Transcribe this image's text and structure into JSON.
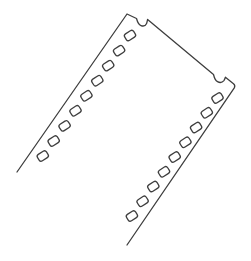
{
  "page": {
    "background_color": "#ffffff"
  },
  "illustration": {
    "description": "Hand-drawn dark-gray outline sketch of a strip of 35mm photographic film tilted diagonally (top end upper-right, lower end running off open toward bottom-left and bottom-right). Two small rounded notches are cut into the top end edge near each corner, and a row of nine small rounded rectangular sprocket holes runs parallel to each long edge.",
    "stroke_color": "#3e3e3e",
    "background_color": "#ffffff",
    "stroke_width": 1.3,
    "canvas": {
      "width": 251,
      "height": 261
    },
    "outline_path": "M 17 172 L 127 14 L 136.5 18.5 C 137.4 21.8 138.4 24.6 141 25.6 C 143.6 26.6 145.6 25.6 146.6 23.4 C 147.2 22 147.3 20.8 147.6 19.4 L 213.5 74.5 C 214.2 77.4 215 80.4 217.5 81.7 C 220 83 222.3 82.5 223.9 80.6 C 224.7 79.6 225 78.4 225.4 77.2 L 233.5 83.7 Q 235.6 85.4 234.3 87.9 L 127 245",
    "sprocket_holes": {
      "count_per_row": 9,
      "width": 10.6,
      "height": 7.6,
      "corner_radius": 2.4,
      "rotation_deg": -33,
      "left_row_centers": [
        [
          130,
          35.5
        ],
        [
          119.1,
          50.6
        ],
        [
          108.2,
          65.6
        ],
        [
          97.3,
          80.7
        ],
        [
          86.4,
          95.8
        ],
        [
          75.5,
          110.8
        ],
        [
          64.6,
          125.9
        ],
        [
          53.7,
          141
        ],
        [
          42.8,
          156
        ]
      ],
      "right_row_centers": [
        [
          217.5,
          98
        ],
        [
          206.8,
          112.8
        ],
        [
          196.1,
          127.5
        ],
        [
          185.4,
          142.3
        ],
        [
          174.7,
          157
        ],
        [
          164,
          171.8
        ],
        [
          153.3,
          186.5
        ],
        [
          142.6,
          201.3
        ],
        [
          131.9,
          216
        ]
      ]
    }
  }
}
